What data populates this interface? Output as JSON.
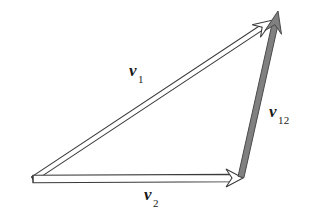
{
  "figure": {
    "kind": "vector-triangle-diagram",
    "width": 323,
    "height": 216,
    "background_color": "#ffffff"
  },
  "colors": {
    "outline": "#3a3a3a",
    "hollow_fill": "#ffffff",
    "solid_gray_fill": "#808080",
    "solid_gray_stroke": "#4a4a4a",
    "text": "#1a1a1a"
  },
  "labels": {
    "v1": {
      "base": "v",
      "subscript": "1",
      "text": "v1"
    },
    "v12": {
      "base": "v",
      "subscript": "12",
      "text": "v12"
    },
    "v2": {
      "base": "v",
      "subscript": "2",
      "text": "v2"
    }
  },
  "chart_data": {
    "type": "diagram",
    "title": "",
    "vectors": [
      {
        "name": "v1",
        "label": "v1",
        "style": "hollow-double-line",
        "fill": "#ffffff",
        "stroke": "#3a3a3a",
        "start": [
          33,
          179
        ],
        "end": [
          273,
          20
        ],
        "label_position": [
          129,
          62
        ]
      },
      {
        "name": "v2",
        "label": "v2",
        "style": "hollow-double-line",
        "fill": "#ffffff",
        "stroke": "#3a3a3a",
        "start": [
          33,
          179
        ],
        "end": [
          243,
          178
        ],
        "label_position": [
          144,
          186
        ]
      },
      {
        "name": "v12",
        "label": "v12",
        "style": "solid-gray",
        "fill": "#808080",
        "stroke": "#4a4a4a",
        "start": [
          241,
          177
        ],
        "end": [
          278,
          11
        ],
        "label_position": [
          269,
          103
        ]
      }
    ],
    "vertices": {
      "origin": [
        33,
        179
      ],
      "top_right": [
        273,
        20
      ],
      "bottom_right": [
        243,
        178
      ]
    },
    "relation": "v1 + v12 = resultant; v2 then v12 reaches the same head as v1"
  }
}
